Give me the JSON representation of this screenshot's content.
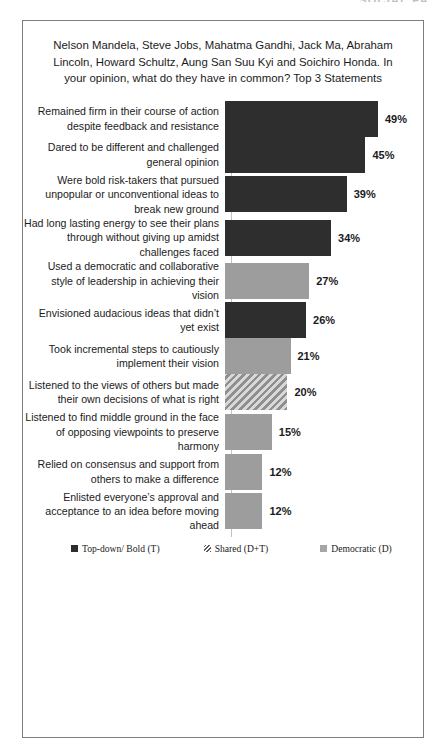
{
  "watermark": "SOCIAL PA",
  "chart_data": {
    "type": "bar",
    "orientation": "horizontal",
    "title": "Nelson Mandela, Steve Jobs, Mahatma Gandhi, Jack Ma, Abraham Lincoln, Howard Schultz, Aung San Suu Kyi and Soichiro Honda. In your opinion, what do they have in common? Top 3 Statements",
    "xlabel": "",
    "ylabel": "",
    "grid": false,
    "legend_position": "bottom",
    "xlim": [
      0,
      50
    ],
    "value_suffix": "%",
    "categories": [
      "Remained firm in their course of action despite feedback and resistance",
      "Dared to be different and challenged general opinion",
      "Were bold risk-takers that pursued unpopular or unconventional ideas to break new ground",
      "Had long lasting energy to see their plans through without giving up amidst challenges faced",
      "Used a democratic and collaborative style of leadership  in achieving their vision",
      "Envisioned audacious  ideas that didn’t yet exist",
      "Took incremental steps to cautiously implement their vision",
      "Listened to the views of others but made their own decisions of what is right",
      "Listened to find middle ground in the face of opposing viewpoints  to preserve harmony",
      "Relied on consensus and support from others to make a difference",
      "Enlisted everyone’s approval and acceptance to an idea before moving ahead"
    ],
    "values": [
      49,
      45,
      39,
      34,
      27,
      26,
      21,
      20,
      15,
      12,
      12
    ],
    "value_labels": [
      "49%",
      "45%",
      "39%",
      "34%",
      "27%",
      "26%",
      "21%",
      "20%",
      "15%",
      "12%",
      "12%"
    ],
    "series_group": [
      "topdown",
      "topdown",
      "topdown",
      "topdown",
      "democratic",
      "topdown",
      "democratic",
      "shared",
      "democratic",
      "democratic",
      "democratic"
    ],
    "legend": [
      {
        "key": "topdown",
        "label": "Top-down/ Bold (T)",
        "color": "#2e2e2e"
      },
      {
        "key": "shared",
        "label": "Shared (D+T)",
        "color": "#8f8f8f"
      },
      {
        "key": "democratic",
        "label": "Democratic (D)",
        "color": "#9d9d9d"
      }
    ]
  },
  "bars": [
    {
      "label": "Remained firm in their course of action despite feedback and resistance",
      "value_label": "49%",
      "group": "topdown"
    },
    {
      "label": "Dared to be different and challenged general opinion",
      "value_label": "45%",
      "group": "topdown"
    },
    {
      "label": "Were bold risk-takers that pursued unpopular or unconventional ideas to break new ground",
      "value_label": "39%",
      "group": "topdown"
    },
    {
      "label": "Had long lasting energy to see their plans through without giving up amidst challenges faced",
      "value_label": "34%",
      "group": "topdown"
    },
    {
      "label": "Used a democratic and collaborative style of leadership  in achieving their vision",
      "value_label": "27%",
      "group": "democratic"
    },
    {
      "label": "Envisioned audacious  ideas that didn’t yet exist",
      "value_label": "26%",
      "group": "topdown"
    },
    {
      "label": "Took incremental steps to cautiously implement their vision",
      "value_label": "21%",
      "group": "democratic"
    },
    {
      "label": "Listened to the views of others but made their own decisions of what is right",
      "value_label": "20%",
      "group": "shared"
    },
    {
      "label": "Listened to find middle ground in the face of opposing viewpoints  to preserve harmony",
      "value_label": "15%",
      "group": "democratic"
    },
    {
      "label": "Relied on consensus and support from others to make a difference",
      "value_label": "12%",
      "group": "democratic"
    },
    {
      "label": "Enlisted everyone’s approval and acceptance to an idea before moving ahead",
      "value_label": "12%",
      "group": "democratic"
    }
  ]
}
